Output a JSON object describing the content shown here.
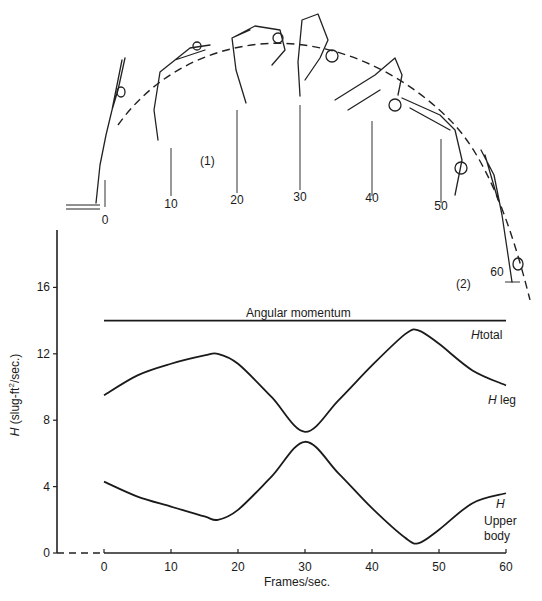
{
  "figure": {
    "phase_labels": [
      "(1)",
      "(2)"
    ],
    "diver_frames": [
      0,
      10,
      20,
      30,
      40,
      50,
      60
    ]
  },
  "chart_data": {
    "type": "line",
    "title": "Angular momentum",
    "xlabel": "Frames/sec.",
    "ylabel_prefix": "H",
    "ylabel_rest": " (slug-ft",
    "ylabel_sup": "2",
    "ylabel_tail": "/sec.)",
    "xlim": [
      0,
      60
    ],
    "ylim": [
      0,
      18
    ],
    "x_ticks": [
      0,
      10,
      20,
      30,
      40,
      50,
      60
    ],
    "y_ticks": [
      0,
      4,
      8,
      12,
      16
    ],
    "grid": false,
    "x": [
      0,
      5,
      10,
      15,
      17,
      20,
      25,
      30,
      35,
      40,
      45,
      47,
      50,
      55,
      60
    ],
    "series": [
      {
        "name": "H total",
        "label_italic": "H",
        "label_rest": "total",
        "values": [
          14.0,
          14.0,
          14.0,
          14.0,
          14.0,
          14.0,
          14.0,
          14.0,
          14.0,
          14.0,
          14.0,
          14.0,
          14.0,
          14.0,
          14.0
        ]
      },
      {
        "name": "H leg",
        "label_italic": "H",
        "label_rest": "leg",
        "values": [
          9.5,
          10.7,
          11.4,
          11.9,
          12.0,
          11.4,
          9.4,
          7.3,
          9.2,
          11.3,
          13.2,
          13.4,
          12.6,
          11.0,
          10.1
        ]
      },
      {
        "name": "H upper body",
        "label_italic": "H",
        "label_rest": "Upper body",
        "label_line1": "Upper",
        "label_line2": "body",
        "values": [
          4.3,
          3.4,
          2.8,
          2.2,
          2.0,
          2.6,
          4.6,
          6.7,
          4.8,
          2.7,
          0.9,
          0.6,
          1.4,
          3.0,
          3.6
        ]
      }
    ],
    "annotations": [
      {
        "text": "Angular momentum",
        "x": 30,
        "y": 14.6
      },
      {
        "text": "H total",
        "x": 60,
        "y": 13.2
      },
      {
        "text": "H leg",
        "x": 60,
        "y": 9.0
      },
      {
        "text": "H Upper body",
        "x": 60,
        "y": 2.0
      }
    ],
    "crossing": {
      "x": 30.5,
      "y": 7.0
    }
  }
}
